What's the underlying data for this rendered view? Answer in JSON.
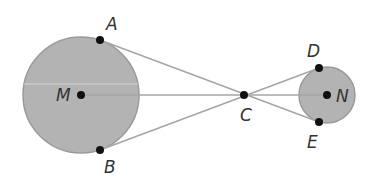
{
  "diagram": {
    "type": "geometry",
    "colors": {
      "circle_fill": "#b3b3b3",
      "circle_stroke": "#9a9a9a",
      "line": "#a6a6a6",
      "point": "#111111",
      "label": "#333333"
    },
    "circles": [
      {
        "name": "M",
        "cx": 81,
        "cy": 95,
        "r": 58
      },
      {
        "name": "N",
        "cx": 327,
        "cy": 95,
        "r": 28
      }
    ],
    "points": [
      {
        "name": "A",
        "x": 100,
        "y": 40
      },
      {
        "name": "B",
        "x": 100,
        "y": 150
      },
      {
        "name": "M",
        "x": 81,
        "y": 95
      },
      {
        "name": "C",
        "x": 244,
        "y": 95
      },
      {
        "name": "D",
        "x": 319,
        "y": 68
      },
      {
        "name": "E",
        "x": 319,
        "y": 122
      },
      {
        "name": "N",
        "x": 327,
        "y": 95
      }
    ],
    "labels": {
      "A": "A",
      "B": "B",
      "C": "C",
      "D": "D",
      "E": "E",
      "M": "M",
      "N": "N"
    },
    "segments": [
      {
        "from": "A",
        "to": "E"
      },
      {
        "from": "B",
        "to": "D"
      },
      {
        "from": "M",
        "to": "N"
      }
    ]
  }
}
